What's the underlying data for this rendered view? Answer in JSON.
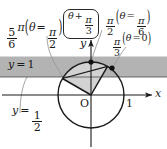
{
  "figure": {
    "type": "geometry-diagram",
    "width": 167,
    "height": 149,
    "colors": {
      "background": "#ffffff",
      "ink": "#1a1a1a",
      "band_fill": "#b3b3b3",
      "sector_fill": "#d2d2d2",
      "leader": "#8c8c8c"
    }
  },
  "axes": {
    "x_label": "x",
    "y_label": "y",
    "origin_label": "O",
    "x_tick_label": "1"
  },
  "labels": {
    "angle_left": {
      "num": "5",
      "den": "6",
      "pi": "π",
      "theta": "θ",
      "equals": "=",
      "arg_num": "π",
      "arg_den": "2",
      "paren_open": "(",
      "paren_close": ")"
    },
    "boxed_expression": {
      "theta": "θ",
      "plus": "+",
      "num": "π",
      "den": "3"
    },
    "angle_top": {
      "num": "π",
      "den": "2",
      "theta": "θ",
      "equals": "=",
      "arg_num": "π",
      "arg_den": "6",
      "paren_open": "(",
      "paren_close": ")"
    },
    "angle_right": {
      "num": "π",
      "den": "3",
      "theta": "θ",
      "equals": "=",
      "arg": "0",
      "paren_open": "(",
      "paren_close": ")"
    },
    "band_upper": {
      "var": "y",
      "equals": "=",
      "value": "1"
    },
    "band_lower": {
      "var": "y",
      "equals": "=",
      "num": "1",
      "den": "2"
    }
  },
  "geometry": {
    "circle": {
      "cx": 91,
      "cy": 95,
      "r": 33,
      "radius_value": "1"
    },
    "band": {
      "y_top_value": "1",
      "y_bottom_value": "1/2"
    },
    "points": [
      {
        "name": "point-at-pi-over-2",
        "angle_deg": 90,
        "x": 91,
        "y": 62
      },
      {
        "name": "point-at-pi-over-3",
        "angle_deg": 60,
        "x": 112,
        "y": 68
      },
      {
        "name": "point-at-5pi-over-6",
        "angle_deg": 150,
        "x": 62,
        "y": 78
      }
    ],
    "sector": {
      "from_angle_deg": 60,
      "to_angle_deg": 150
    }
  }
}
